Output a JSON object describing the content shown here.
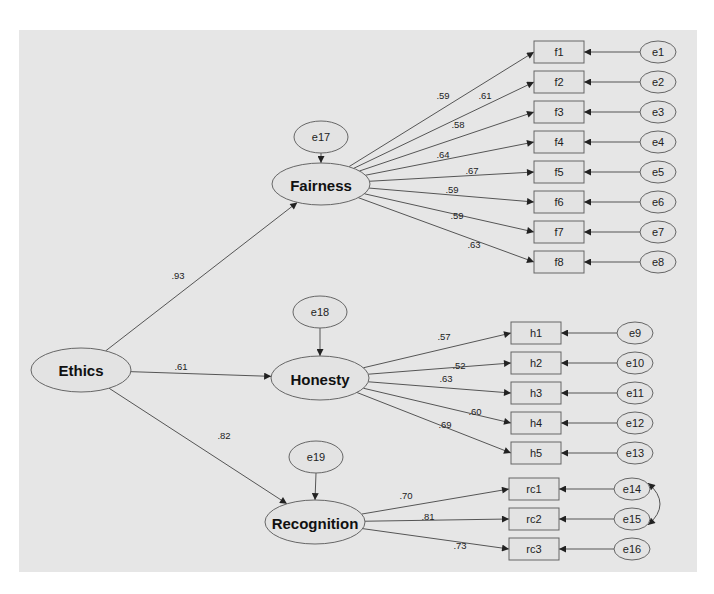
{
  "diagram": {
    "type": "structural-equation-model",
    "colors": {
      "background": "#e6e6e6",
      "stroke": "#555555",
      "node_fill": "#e3e3e3"
    },
    "second_order_factor": {
      "id": "ethics",
      "label": "Ethics",
      "cx": 81,
      "cy": 370,
      "rx": 50,
      "ry": 22
    },
    "first_order_factors": [
      {
        "id": "fairness",
        "label": "Fairness",
        "cx": 321,
        "cy": 184,
        "rx": 49,
        "ry": 21,
        "loading": ".93",
        "loading_pos": [
          178,
          275
        ],
        "disturbance": {
          "label": "e17",
          "cx": 321,
          "cy": 137,
          "rx": 27,
          "ry": 16
        }
      },
      {
        "id": "honesty",
        "label": "Honesty",
        "cx": 320,
        "cy": 378,
        "rx": 49,
        "ry": 22,
        "loading": ".61",
        "loading_pos": [
          181,
          366
        ],
        "disturbance": {
          "label": "e18",
          "cx": 320,
          "cy": 312,
          "rx": 27,
          "ry": 16
        }
      },
      {
        "id": "recognition",
        "label": "Recognition",
        "cx": 315,
        "cy": 522,
        "rx": 50,
        "ry": 22,
        "loading": ".82",
        "loading_pos": [
          224,
          435
        ],
        "disturbance": {
          "label": "e19",
          "cx": 316,
          "cy": 457,
          "rx": 27,
          "ry": 16
        }
      }
    ],
    "indicators": [
      {
        "factor": "fairness",
        "label": "f1",
        "x": 534,
        "y": 41,
        "loading": ".59",
        "lx": 443,
        "ly": 95,
        "error": {
          "label": "e1",
          "cx": 658,
          "cy": 52
        }
      },
      {
        "factor": "fairness",
        "label": "f2",
        "x": 534,
        "y": 71,
        "loading": ".61",
        "lx": 485,
        "ly": 95,
        "error": {
          "label": "e2",
          "cx": 658,
          "cy": 82
        }
      },
      {
        "factor": "fairness",
        "label": "f3",
        "x": 534,
        "y": 101,
        "loading": ".58",
        "lx": 458,
        "ly": 124,
        "error": {
          "label": "e3",
          "cx": 658,
          "cy": 112
        }
      },
      {
        "factor": "fairness",
        "label": "f4",
        "x": 534,
        "y": 131,
        "loading": ".64",
        "lx": 443,
        "ly": 154,
        "error": {
          "label": "e4",
          "cx": 658,
          "cy": 142
        }
      },
      {
        "factor": "fairness",
        "label": "f5",
        "x": 534,
        "y": 161,
        "loading": ".67",
        "lx": 472,
        "ly": 170,
        "error": {
          "label": "e5",
          "cx": 658,
          "cy": 172
        }
      },
      {
        "factor": "fairness",
        "label": "f6",
        "x": 534,
        "y": 191,
        "loading": ".59",
        "lx": 452,
        "ly": 189,
        "error": {
          "label": "e6",
          "cx": 658,
          "cy": 202
        }
      },
      {
        "factor": "fairness",
        "label": "f7",
        "x": 534,
        "y": 221,
        "loading": ".59",
        "lx": 457,
        "ly": 215,
        "error": {
          "label": "e7",
          "cx": 658,
          "cy": 232
        }
      },
      {
        "factor": "fairness",
        "label": "f8",
        "x": 534,
        "y": 251,
        "loading": ".63",
        "lx": 474,
        "ly": 244,
        "error": {
          "label": "e8",
          "cx": 658,
          "cy": 262
        }
      },
      {
        "factor": "honesty",
        "label": "h1",
        "x": 511,
        "y": 322,
        "loading": ".57",
        "lx": 444,
        "ly": 336,
        "error": {
          "label": "e9",
          "cx": 635,
          "cy": 333
        }
      },
      {
        "factor": "honesty",
        "label": "h2",
        "x": 511,
        "y": 352,
        "loading": ".52",
        "lx": 459,
        "ly": 365,
        "error": {
          "label": "e10",
          "cx": 635,
          "cy": 363
        }
      },
      {
        "factor": "honesty",
        "label": "h3",
        "x": 511,
        "y": 382,
        "loading": ".63",
        "lx": 446,
        "ly": 378,
        "error": {
          "label": "e11",
          "cx": 635,
          "cy": 393
        }
      },
      {
        "factor": "honesty",
        "label": "h4",
        "x": 511,
        "y": 412,
        "loading": ".60",
        "lx": 475,
        "ly": 411,
        "error": {
          "label": "e12",
          "cx": 635,
          "cy": 423
        }
      },
      {
        "factor": "honesty",
        "label": "h5",
        "x": 511,
        "y": 442,
        "loading": ".69",
        "lx": 445,
        "ly": 424,
        "error": {
          "label": "e13",
          "cx": 635,
          "cy": 453
        }
      },
      {
        "factor": "recognition",
        "label": "rc1",
        "x": 509,
        "y": 478,
        "loading": ".70",
        "lx": 406,
        "ly": 495,
        "error": {
          "label": "e14",
          "cx": 632,
          "cy": 489
        }
      },
      {
        "factor": "recognition",
        "label": "rc2",
        "x": 509,
        "y": 508,
        "loading": ".81",
        "lx": 428,
        "ly": 516,
        "error": {
          "label": "e15",
          "cx": 632,
          "cy": 519
        }
      },
      {
        "factor": "recognition",
        "label": "rc3",
        "x": 509,
        "y": 538,
        "loading": ".73",
        "lx": 460,
        "ly": 545,
        "error": {
          "label": "e16",
          "cx": 632,
          "cy": 549
        }
      }
    ],
    "covariances": [
      {
        "from": "e14",
        "to": "e15"
      }
    ]
  }
}
